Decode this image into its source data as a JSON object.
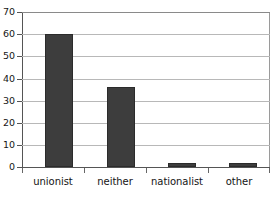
{
  "chart_data": {
    "type": "bar",
    "title": "",
    "subtitle": "",
    "xlabel": "",
    "ylabel": "",
    "categories": [
      "unionist",
      "neither",
      "nationalist",
      "other"
    ],
    "values": [
      60,
      36,
      2,
      2
    ],
    "series": [
      {
        "name": "",
        "values": [
          60,
          36,
          2,
          2
        ]
      }
    ],
    "ylim": [
      0,
      70
    ],
    "ytick_values": [
      0,
      10,
      20,
      30,
      40,
      50,
      60,
      70
    ],
    "ytick_labels": [
      "0",
      "10",
      "20",
      "30",
      "40",
      "50",
      "60",
      "70"
    ],
    "ytick_step": 10,
    "grid": true,
    "grid_axis": "y",
    "legend": false,
    "legend_position": "none",
    "bar_color": "#3d3d3d",
    "grid_color": "#b8b8b8",
    "axis_color": "#555555",
    "background": "#ffffff",
    "annotations": []
  }
}
